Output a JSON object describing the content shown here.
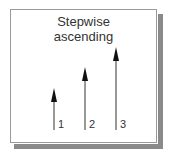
{
  "title": {
    "line1": "Stepwise",
    "line2": "ascending"
  },
  "arrows": [
    {
      "label": "1",
      "x": 54,
      "tip_y": 88,
      "base_y": 130
    },
    {
      "label": "2",
      "x": 85,
      "tip_y": 67,
      "base_y": 130
    },
    {
      "label": "3",
      "x": 116,
      "tip_y": 47,
      "base_y": 130
    }
  ],
  "colors": {
    "frame_border": "#9a9a9a",
    "shadow": "#8a8a8a",
    "arrow_shaft": "#777777",
    "arrow_head": "#111111",
    "text": "#333333"
  }
}
